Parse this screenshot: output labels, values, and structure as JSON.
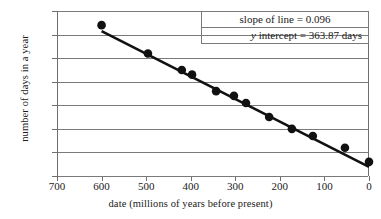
{
  "chart_data": {
    "type": "scatter",
    "title": "",
    "xlabel": "date (millions of years before present)",
    "ylabel": "number of days in a year",
    "xlim": [
      700,
      0
    ],
    "ylim": [
      360,
      430
    ],
    "x_ticks": [
      700,
      600,
      500,
      400,
      300,
      200,
      100,
      0
    ],
    "y_ticks": [
      360,
      370,
      380,
      390,
      400,
      410,
      420,
      430
    ],
    "grid": "horizontal",
    "legend": "none",
    "x_axis_reversed": true,
    "x": [
      600,
      496,
      420,
      397,
      343,
      303,
      276,
      224,
      173,
      126,
      54,
      0
    ],
    "y": [
      424,
      412,
      405,
      403,
      396,
      394,
      391,
      385,
      380,
      377,
      372,
      366
    ],
    "points": [
      {
        "x": 600,
        "y": 424
      },
      {
        "x": 496,
        "y": 412
      },
      {
        "x": 420,
        "y": 405
      },
      {
        "x": 397,
        "y": 403
      },
      {
        "x": 343,
        "y": 396
      },
      {
        "x": 303,
        "y": 394
      },
      {
        "x": 276,
        "y": 391
      },
      {
        "x": 224,
        "y": 385
      },
      {
        "x": 173,
        "y": 380
      },
      {
        "x": 126,
        "y": 377
      },
      {
        "x": 54,
        "y": 372
      },
      {
        "x": 0,
        "y": 366
      }
    ],
    "trendline": {
      "slope": 0.096,
      "intercept": 363.87,
      "x_start": 600,
      "x_end": 0
    },
    "annotations": [
      "slope of line = 0.096",
      "y intercept = 363.87 days"
    ]
  },
  "annotation_box": {
    "slope_text": "slope of line = 0.096",
    "intercept_prefix": "y",
    "intercept_text": " intercept = 363.87 days"
  }
}
